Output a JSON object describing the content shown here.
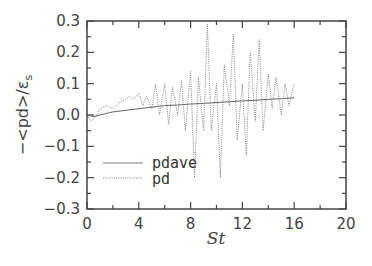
{
  "chart_data": {
    "type": "line",
    "title": "",
    "xlabel": "St",
    "ylabel": "−<pd>/ε_s",
    "xlim": [
      0,
      20
    ],
    "ylim": [
      -0.3,
      0.3
    ],
    "x_ticks": [
      0,
      4,
      8,
      12,
      16,
      20
    ],
    "x_tick_labels": [
      "0",
      "4",
      "8",
      "12",
      "16",
      "20"
    ],
    "y_ticks": [
      0.3,
      0.2,
      0.1,
      0.0,
      -0.1,
      -0.2,
      -0.3
    ],
    "y_tick_labels": [
      "0.3",
      "0.2",
      "0.1",
      "0.0",
      "−0.1",
      "−0.2",
      "−0.3"
    ],
    "grid": false,
    "legend_position": "lower left",
    "series": [
      {
        "name": "pdave",
        "style": "solid",
        "x": [
          0,
          0.5,
          1,
          2,
          3,
          4,
          5,
          6,
          7,
          8,
          9,
          10,
          11,
          12,
          13,
          14,
          15,
          16
        ],
        "y": [
          0.0,
          -0.005,
          0.0,
          0.01,
          0.015,
          0.02,
          0.025,
          0.03,
          0.032,
          0.035,
          0.037,
          0.04,
          0.042,
          0.045,
          0.047,
          0.05,
          0.052,
          0.055
        ]
      },
      {
        "name": "pd",
        "style": "dotted",
        "x": [
          0,
          0.3,
          0.6,
          1.0,
          1.5,
          2.0,
          2.5,
          3.0,
          3.3,
          3.6,
          4.0,
          4.3,
          4.6,
          5.0,
          5.3,
          5.6,
          6.0,
          6.3,
          6.6,
          7.0,
          7.3,
          7.6,
          8.0,
          8.3,
          8.6,
          9.0,
          9.3,
          9.6,
          10.0,
          10.3,
          10.6,
          11.0,
          11.3,
          11.6,
          12.0,
          12.3,
          12.6,
          13.0,
          13.3,
          13.6,
          14.0,
          14.3,
          14.6,
          15.0,
          15.3,
          15.6,
          16.0
        ],
        "y": [
          0.0,
          -0.02,
          -0.01,
          0.02,
          0.03,
          0.02,
          0.04,
          0.05,
          0.06,
          0.05,
          0.07,
          0.03,
          0.06,
          0.02,
          0.1,
          0.0,
          0.1,
          -0.03,
          0.09,
          0.0,
          0.11,
          -0.05,
          0.14,
          -0.2,
          0.12,
          -0.05,
          0.29,
          -0.05,
          0.1,
          -0.2,
          0.16,
          0.03,
          0.26,
          -0.08,
          0.1,
          -0.13,
          0.2,
          -0.02,
          0.24,
          -0.05,
          0.13,
          0.02,
          0.12,
          0.0,
          0.1,
          0.03,
          0.1
        ]
      }
    ]
  },
  "legend": {
    "items": [
      {
        "label": "pdave",
        "style": "solid"
      },
      {
        "label": "pd",
        "style": "dotted"
      }
    ]
  },
  "axes": {
    "xlabel": "St",
    "ylabel_prefix": "−<pd>/ε",
    "ylabel_sub": "s"
  },
  "colors": {
    "axis": "#444444",
    "pdave": "#555555",
    "pd": "#777777"
  }
}
